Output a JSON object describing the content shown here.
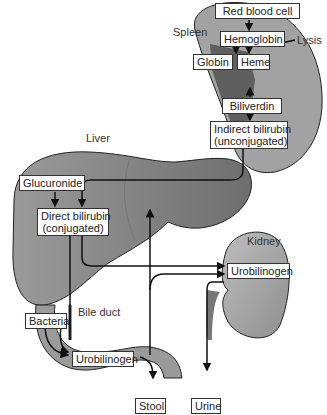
{
  "organs": {
    "spleen": "Spleen",
    "liver": "Liver",
    "kidney": "Kidney",
    "bile_duct": "Bile duct"
  },
  "annotations": {
    "lysis": "Lysis"
  },
  "nodes": {
    "red_blood_cell": "Red blood cell",
    "hemoglobin": "Hemoglobin",
    "globin": "Globin",
    "heme": "Heme",
    "biliverdin": "Biliverdin",
    "indirect_bilirubin": "Indirect bilirubin",
    "indirect_bilirubin_sub": "(unconjugated)",
    "glucuronide": "Glucuronide",
    "direct_bilirubin": "Direct bilirubin",
    "direct_bilirubin_sub": "(conjugated)",
    "bacteria": "Bacteria",
    "urobilinogen_intestine": "Urobilinogen",
    "urobilinogen_kidney": "Urobilinogen",
    "stool": "Stool",
    "urine": "Urine"
  },
  "colors": {
    "organ_fill": "#8a8a8a",
    "organ_light": "#b0b0b0",
    "organ_dark": "#5e5e5e",
    "stroke": "#111111"
  }
}
